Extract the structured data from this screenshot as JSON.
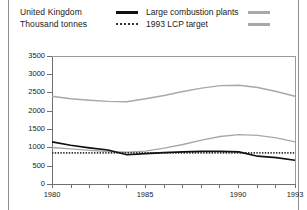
{
  "header": {
    "country": "United Kingdom",
    "units": "Thousand tonnes"
  },
  "legend": {
    "items": [
      {
        "label": "Large combustion plants",
        "style": "solid",
        "color": "#111111"
      },
      {
        "label": "1993 LCP target",
        "style": "dotted",
        "color": "#333333"
      }
    ],
    "unlabeled_swatches": [
      {
        "label": "",
        "style": "solid",
        "color": "#a8a8a8"
      },
      {
        "label": "",
        "style": "solid",
        "color": "#a8a8a8"
      }
    ]
  },
  "chart_data": {
    "type": "line",
    "title": "United Kingdom",
    "xlabel": "",
    "ylabel": "Thousand tonnes",
    "ylim": [
      0,
      3500
    ],
    "xlim": [
      1980,
      1993
    ],
    "yticks": [
      0,
      500,
      1000,
      1500,
      2000,
      2500,
      3000,
      3500
    ],
    "xticks": [
      1980,
      1981,
      1982,
      1983,
      1984,
      1985,
      1986,
      1987,
      1988,
      1989,
      1990,
      1991,
      1992,
      1993
    ],
    "xticklabels": [
      "1980",
      "",
      "",
      "",
      "",
      "1985",
      "",
      "",
      "",
      "",
      "1990",
      "",
      "",
      "1993"
    ],
    "grid": false,
    "legend_position": "top",
    "x": [
      1980,
      1981,
      1982,
      1983,
      1984,
      1985,
      1986,
      1987,
      1988,
      1989,
      1990,
      1991,
      1992,
      1993
    ],
    "series": [
      {
        "name": "upper-gray",
        "label": "",
        "color": "#a8a8a8",
        "style": "solid",
        "values": [
          2400,
          2330,
          2290,
          2260,
          2250,
          2330,
          2420,
          2530,
          2620,
          2690,
          2700,
          2640,
          2530,
          2400
        ]
      },
      {
        "name": "lower-gray",
        "label": "",
        "color": "#a8a8a8",
        "style": "solid",
        "values": [
          1000,
          960,
          920,
          890,
          870,
          900,
          980,
          1080,
          1200,
          1300,
          1350,
          1330,
          1260,
          1150
        ]
      },
      {
        "name": "Large combustion plants",
        "label": "Large combustion plants",
        "color": "#111111",
        "style": "solid",
        "values": [
          1150,
          1060,
          990,
          930,
          800,
          830,
          860,
          880,
          890,
          890,
          880,
          760,
          720,
          650
        ]
      },
      {
        "name": "1993 LCP target",
        "label": "1993 LCP target",
        "color": "#333333",
        "style": "dotted",
        "values": [
          850,
          850,
          850,
          850,
          850,
          850,
          850,
          850,
          850,
          850,
          850,
          850,
          850,
          850
        ]
      }
    ]
  }
}
